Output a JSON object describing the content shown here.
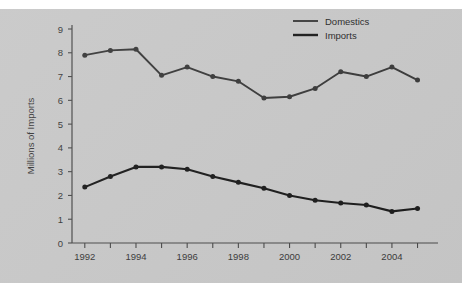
{
  "figure": {
    "background_color": "#c8c8c8",
    "page_background_color": "#ffffff"
  },
  "chart_data": {
    "type": "line",
    "title": "",
    "subtitle": "",
    "xlabel": "",
    "ylabel": "Millions of Imports",
    "x": [
      1992,
      1993,
      1994,
      1995,
      1996,
      1997,
      1998,
      1999,
      2000,
      2001,
      2002,
      2003,
      2004,
      2005
    ],
    "categories": [
      "1992",
      "1993",
      "1994",
      "1995",
      "1996",
      "1997",
      "1998",
      "1999",
      "2000",
      "2001",
      "2002",
      "2003",
      "2004",
      "2005"
    ],
    "series": [
      {
        "name": "Domestics",
        "color": "#3a3a3a",
        "values": [
          7.9,
          8.1,
          8.15,
          7.05,
          7.4,
          7.0,
          6.8,
          6.1,
          6.15,
          6.5,
          7.2,
          7.0,
          7.4,
          6.85
        ]
      },
      {
        "name": "Imports",
        "color": "#1c1c1c",
        "values": [
          2.35,
          2.8,
          3.2,
          3.2,
          3.1,
          2.8,
          2.55,
          2.3,
          2.0,
          1.8,
          1.68,
          1.6,
          1.33,
          1.45
        ]
      }
    ],
    "xlim": [
      1991.5,
      2005.8
    ],
    "ylim": [
      0,
      9
    ],
    "ytick_labels": [
      "0",
      "1",
      "2",
      "3",
      "4",
      "5",
      "6",
      "7",
      "8",
      "9"
    ],
    "ytick_values": [
      0,
      1,
      2,
      3,
      4,
      5,
      6,
      7,
      8,
      9
    ],
    "xtick_labels": [
      "1992",
      "1994",
      "1996",
      "1998",
      "2000",
      "2002",
      "2004"
    ],
    "xtick_values": [
      1992,
      1994,
      1996,
      1998,
      2000,
      2002,
      2004
    ],
    "xtick_minor_values": [
      1992,
      1993,
      1994,
      1995,
      1996,
      1997,
      1998,
      1999,
      2000,
      2001,
      2002,
      2003,
      2004,
      2005
    ],
    "grid": false,
    "legend_position": "top-right",
    "legend_entries": [
      "Domestics",
      "Imports"
    ],
    "markers": "filled-circle"
  }
}
